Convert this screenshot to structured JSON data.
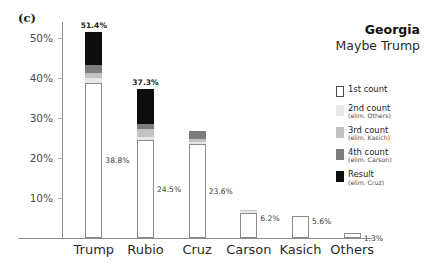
{
  "panel_label": "(c)",
  "title": {
    "main": "Georgia",
    "sub": "Maybe Trump"
  },
  "legend": {
    "items": [
      {
        "label": "1st count",
        "note": "",
        "swatch": "white"
      },
      {
        "label": "2nd count",
        "note": "(elim. Others)",
        "swatch": "light-gray"
      },
      {
        "label": "3rd count",
        "note": "(elim. Kasich)",
        "swatch": "gray"
      },
      {
        "label": "4th count",
        "note": "(elim. Carson)",
        "swatch": "dark-gray"
      },
      {
        "label": "Result",
        "note": "(elim. Cruz)",
        "swatch": "black"
      }
    ]
  },
  "chart_data": {
    "type": "bar",
    "title": "Georgia",
    "subtitle": "Maybe Trump",
    "xlabel": "",
    "ylabel": "",
    "ylim": [
      0,
      54
    ],
    "grid": false,
    "stacked": true,
    "legend_position": "right",
    "categories": [
      "Trump",
      "Rubio",
      "Cruz",
      "Carson",
      "Kasich",
      "Others"
    ],
    "series": [
      {
        "name": "1st count",
        "note": "",
        "color": "#ffffff",
        "values": [
          38.8,
          24.5,
          23.6,
          6.2,
          5.6,
          1.3
        ]
      },
      {
        "name": "2nd count",
        "note": "(elim. Others)",
        "color": "#e8e8e8",
        "values": [
          1.1,
          0.7,
          0.5,
          0.5,
          0.0,
          0.0
        ]
      },
      {
        "name": "3rd count",
        "note": "(elim. Kasich)",
        "color": "#c2c2c2",
        "values": [
          1.4,
          2.1,
          0.6,
          0.4,
          0.0,
          0.0
        ]
      },
      {
        "name": "4th count",
        "note": "(elim. Carson)",
        "color": "#7d7d7d",
        "values": [
          2.0,
          1.3,
          2.1,
          0.0,
          0.0,
          0.0
        ]
      },
      {
        "name": "Result",
        "note": "(elim. Cruz)",
        "color": "#0d0d0d",
        "values": [
          8.1,
          8.7,
          0.0,
          0.0,
          0.0,
          0.0
        ]
      }
    ],
    "totals": [
      51.4,
      37.3,
      26.8,
      7.1,
      5.6,
      1.3
    ],
    "top_labels": [
      "51.4%",
      "37.3%",
      "",
      "",
      "",
      ""
    ],
    "first_count_labels": [
      "38.8%",
      "24.5%",
      "23.6%",
      "6.2%",
      "5.6%",
      "1.3%"
    ],
    "yticks": [
      10,
      20,
      30,
      40,
      50
    ],
    "ytick_labels": [
      "10%",
      "20%",
      "30%",
      "40%",
      "50%"
    ]
  }
}
